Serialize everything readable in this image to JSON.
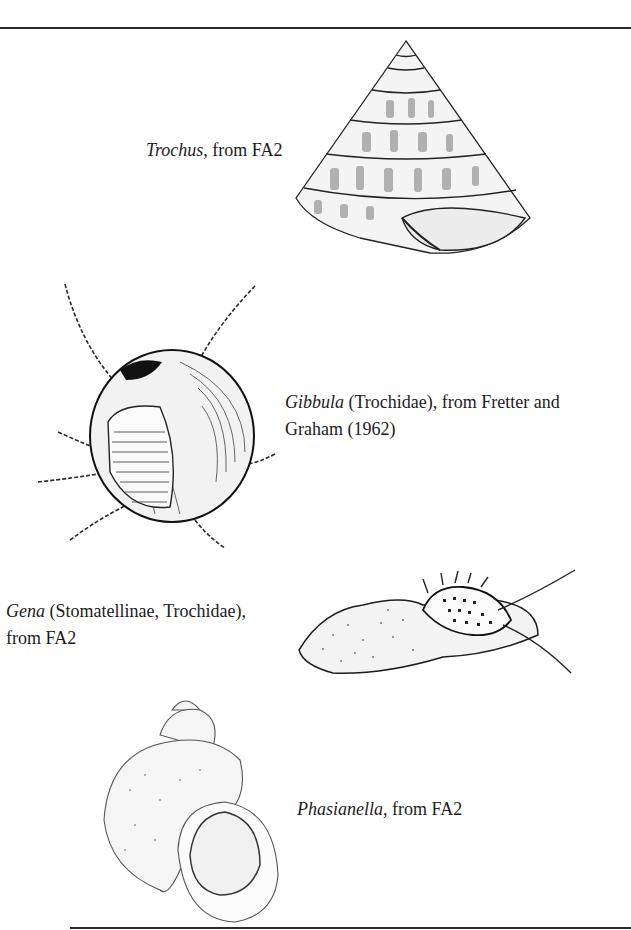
{
  "figures": [
    {
      "id": "trochus",
      "genus": "Trochus",
      "caption_rest": ", from FA2"
    },
    {
      "id": "gibbula",
      "genus": "Gibbula",
      "caption_rest_line1": " (Trochidae), from Fretter and",
      "caption_line2": "Graham (1962)"
    },
    {
      "id": "gena",
      "genus": "Gena",
      "caption_rest_line1": " (Stomatellinae, Trochidae),",
      "caption_line2": "from FA2"
    },
    {
      "id": "phasianella",
      "genus": "Phasianella",
      "caption_rest": ", from FA2"
    }
  ],
  "colors": {
    "ink": "#1c1c1c",
    "rule": "#2a2a2a",
    "background": "#ffffff"
  }
}
